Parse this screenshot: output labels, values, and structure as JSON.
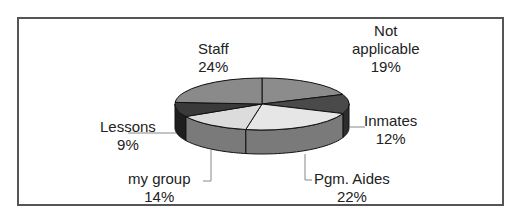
{
  "chart_data": {
    "type": "pie",
    "style": "3d",
    "title": "",
    "categories": [
      "Not applicable",
      "Inmates",
      "Pgm. Aides",
      "my group",
      "Lessons",
      "Staff"
    ],
    "values": [
      19,
      12,
      22,
      14,
      9,
      24
    ],
    "unit": "%",
    "labels": [
      {
        "name": "Not applicable",
        "name_lines": [
          "Not",
          "applicable"
        ],
        "pct": "19%"
      },
      {
        "name": "Inmates",
        "name_lines": [
          "Inmates"
        ],
        "pct": "12%"
      },
      {
        "name": "Pgm. Aides",
        "name_lines": [
          "Pgm. Aides"
        ],
        "pct": "22%"
      },
      {
        "name": "my group",
        "name_lines": [
          "my group"
        ],
        "pct": "14%"
      },
      {
        "name": "Lessons",
        "name_lines": [
          "Lessons"
        ],
        "pct": "9%"
      },
      {
        "name": "Staff",
        "name_lines": [
          "Staff"
        ],
        "pct": "24%"
      }
    ],
    "colors": [
      "#8c8c8c",
      "#4a4a4a",
      "#e6e6e6",
      "#dcdcdc",
      "#3a3a3a",
      "#8a8a8a"
    ],
    "side_colors": [
      "#6e6e6e",
      "#2e2e2e",
      "#7a7a7a",
      "#7a7a7a",
      "#1e1e1e",
      "#6a6a6a"
    ],
    "legend": "none",
    "data_labels": "category and percentage with leader lines"
  },
  "labels": {
    "staff": {
      "name": "Staff",
      "pct": "24%"
    },
    "not_applicable": {
      "line1": "Not",
      "line2": "applicable",
      "pct": "19%"
    },
    "inmates": {
      "name": "Inmates",
      "pct": "12%"
    },
    "pgm_aides": {
      "name": "Pgm. Aides",
      "pct": "22%"
    },
    "my_group": {
      "name": "my group",
      "pct": "14%"
    },
    "lessons": {
      "name": "Lessons",
      "pct": "9%"
    }
  }
}
